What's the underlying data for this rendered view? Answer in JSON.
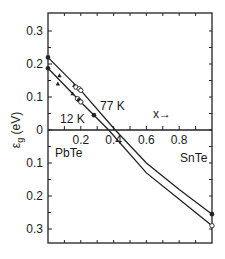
{
  "chart_data": {
    "type": "line",
    "title": "",
    "xlabel": "x",
    "ylabel": "ε_g (eV)",
    "x_arrow_label": "x→",
    "xlim": [
      0,
      1
    ],
    "ylim": [
      -0.33,
      0.34
    ],
    "y_axis_note": "Lower half labeled with positive magnitudes 0.1, 0.2, 0.3 (inverted gap below zero)",
    "x_ticks": [
      0.2,
      0.4,
      0.6,
      0.8
    ],
    "x_tick_labels": [
      "0.2",
      "0.4",
      "0.6",
      "0.8"
    ],
    "y_ticks_upper": [
      0.3,
      0.2,
      0.1,
      0
    ],
    "y_tick_labels_upper": [
      "0.3",
      "0.2",
      "0.1",
      "0"
    ],
    "y_ticks_lower": [
      -0.1,
      -0.2,
      -0.3
    ],
    "y_tick_labels_lower": [
      "0.1",
      "0.2",
      "0.3"
    ],
    "grid": false,
    "annotations": {
      "left_end": "PbTe",
      "right_end": "SnTe",
      "curve_12k": "12 K",
      "curve_77k": "77 K"
    },
    "series": [
      {
        "name": "77 K",
        "x": [
          0,
          0.2,
          0.41,
          0.6,
          0.8,
          1.0
        ],
        "y": [
          0.22,
          0.12,
          0.0,
          -0.1,
          -0.18,
          -0.255
        ]
      },
      {
        "name": "12 K",
        "x": [
          0,
          0.2,
          0.37,
          0.6,
          0.8,
          1.0
        ],
        "y": [
          0.187,
          0.085,
          0.0,
          -0.13,
          -0.21,
          -0.29
        ]
      }
    ],
    "points": [
      {
        "x": 0.0,
        "y": 0.22,
        "marker": "filled-circle"
      },
      {
        "x": 0.0,
        "y": 0.187,
        "marker": "filled-circle"
      },
      {
        "x": 0.07,
        "y": 0.165,
        "marker": "filled-triangle"
      },
      {
        "x": 0.06,
        "y": 0.14,
        "marker": "filled-triangle"
      },
      {
        "x": 0.16,
        "y": 0.135,
        "marker": "filled-triangle"
      },
      {
        "x": 0.17,
        "y": 0.13,
        "marker": "open-circle"
      },
      {
        "x": 0.19,
        "y": 0.125,
        "marker": "open-circle"
      },
      {
        "x": 0.2,
        "y": 0.12,
        "marker": "open-circle"
      },
      {
        "x": 0.15,
        "y": 0.11,
        "marker": "filled-triangle"
      },
      {
        "x": 0.18,
        "y": 0.095,
        "marker": "open-circle"
      },
      {
        "x": 0.19,
        "y": 0.09,
        "marker": "filled-circle"
      },
      {
        "x": 0.2,
        "y": 0.085,
        "marker": "open-circle"
      },
      {
        "x": 0.28,
        "y": 0.045,
        "marker": "filled-circle"
      },
      {
        "x": 1.0,
        "y": -0.255,
        "marker": "filled-circle"
      },
      {
        "x": 1.0,
        "y": -0.29,
        "marker": "open-circle"
      }
    ]
  }
}
